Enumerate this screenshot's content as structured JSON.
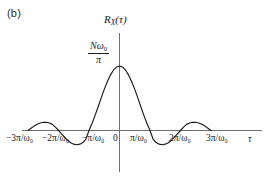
{
  "figure": {
    "panel_label": "(b)",
    "background_color": "#ffffff",
    "line_color": "#1a1a1a",
    "axis_color": "#6e6e6e"
  },
  "labels": {
    "y_axis_function": {
      "base": "R",
      "subscript": "X",
      "argument": "(τ)"
    },
    "peak_value": {
      "numerator_n": "N",
      "numerator_omega": "ω",
      "numerator_omega_sub": "0",
      "denominator": "π"
    },
    "x_axis_variable": "τ"
  },
  "chart_data": {
    "type": "line",
    "title": "",
    "subtitle": "",
    "panel": "(b)",
    "xlabel": "τ",
    "ylabel": "R_X(τ)",
    "formula": "R_X(tau) = (N*omega0/pi) * sin(omega0*tau)/(omega0*tau)",
    "grid": false,
    "legend": false,
    "xlim": [
      -3.35,
      3.35
    ],
    "ylim": [
      -0.33,
      1.12
    ],
    "x_unit": "π/ω₀",
    "y_peak_label": "Nω₀/π",
    "xticks": [
      -3,
      -2,
      -1,
      0,
      1,
      2,
      3
    ],
    "xticklabels": [
      "−3π/ω₀",
      "−2π/ω₀",
      "−π/ω₀",
      "0",
      "π/ω₀",
      "2π/ω₀",
      "3π/ω₀"
    ],
    "yticks": [
      0,
      1
    ],
    "yticklabels": [
      "0",
      "Nω₀/π"
    ],
    "zero_crossings": [
      -3,
      -2,
      -1,
      1,
      2,
      3
    ],
    "key_points": [
      {
        "x": -3.0,
        "y": 0.0,
        "note": "curve start / zero crossing"
      },
      {
        "x": -2.46,
        "y": 0.128,
        "note": "left outer side lobe peak"
      },
      {
        "x": -2.0,
        "y": 0.0,
        "note": "zero crossing"
      },
      {
        "x": -1.43,
        "y": -0.217,
        "note": "left negative lobe minimum"
      },
      {
        "x": -1.0,
        "y": 0.0,
        "note": "zero crossing"
      },
      {
        "x": 0.0,
        "y": 1.0,
        "note": "main lobe peak = Nω₀/π"
      },
      {
        "x": 1.0,
        "y": 0.0,
        "note": "zero crossing"
      },
      {
        "x": 1.43,
        "y": -0.217,
        "note": "right negative lobe minimum"
      },
      {
        "x": 2.0,
        "y": 0.0,
        "note": "zero crossing"
      },
      {
        "x": 2.46,
        "y": 0.128,
        "note": "right outer side lobe peak"
      },
      {
        "x": 3.0,
        "y": 0.0,
        "note": "curve end / zero crossing"
      }
    ],
    "series": [
      {
        "name": "R_X(τ)",
        "x": [
          -3.0,
          -2.9,
          -2.8,
          -2.7,
          -2.6,
          -2.5,
          -2.4,
          -2.3,
          -2.2,
          -2.1,
          -2.0,
          -1.9,
          -1.8,
          -1.7,
          -1.6,
          -1.5,
          -1.4,
          -1.3,
          -1.2,
          -1.1,
          -1.0,
          -0.9,
          -0.8,
          -0.7,
          -0.6,
          -0.5,
          -0.4,
          -0.3,
          -0.2,
          -0.1,
          0.0,
          0.1,
          0.2,
          0.3,
          0.4,
          0.5,
          0.6,
          0.7,
          0.8,
          0.9,
          1.0,
          1.1,
          1.2,
          1.3,
          1.4,
          1.5,
          1.6,
          1.7,
          1.8,
          1.9,
          2.0,
          2.1,
          2.2,
          2.3,
          2.4,
          2.5,
          2.6,
          2.7,
          2.8,
          2.9,
          3.0
        ],
        "y": [
          0.0,
          0.034,
          0.068,
          0.097,
          0.116,
          0.127,
          0.127,
          0.116,
          0.095,
          0.053,
          0.0,
          -0.051,
          -0.104,
          -0.152,
          -0.189,
          -0.212,
          -0.221,
          -0.212,
          -0.187,
          -0.132,
          0.0,
          0.109,
          0.234,
          0.368,
          0.505,
          0.637,
          0.757,
          0.858,
          0.935,
          0.984,
          1.0,
          0.984,
          0.935,
          0.858,
          0.757,
          0.637,
          0.505,
          0.368,
          0.234,
          0.109,
          0.0,
          -0.132,
          -0.187,
          -0.212,
          -0.221,
          -0.212,
          -0.189,
          -0.152,
          -0.104,
          -0.051,
          0.0,
          0.053,
          0.095,
          0.116,
          0.127,
          0.127,
          0.116,
          0.097,
          0.068,
          0.034,
          0.0
        ]
      }
    ]
  }
}
